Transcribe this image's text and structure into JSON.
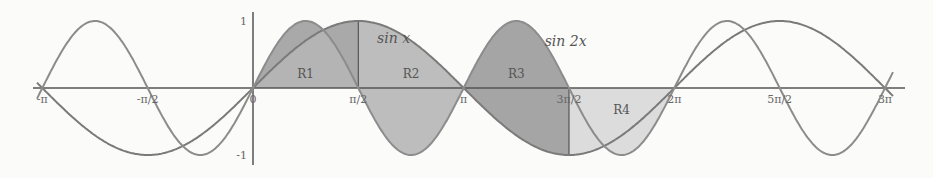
{
  "chart_data": {
    "type": "line",
    "title": "",
    "xlabel": "",
    "ylabel": "",
    "xlim": [
      -3.14159,
      9.42478
    ],
    "ylim": [
      -1,
      1
    ],
    "grid": false,
    "series": [
      {
        "name": "sin x",
        "function": "sin(x)",
        "color": "#7a7a7a"
      },
      {
        "name": "sin 2x",
        "function": "sin(2x)",
        "color": "#8c8c8c"
      }
    ],
    "x_ticks": [
      {
        "label": "-π",
        "value": -3.14159
      },
      {
        "label": "-π/2",
        "value": -1.5708
      },
      {
        "label": "0",
        "value": 0
      },
      {
        "label": "π/2",
        "value": 1.5708
      },
      {
        "label": "π",
        "value": 3.14159
      },
      {
        "label": "3π/2",
        "value": 4.71239
      },
      {
        "label": "2π",
        "value": 6.28319
      },
      {
        "label": "5π/2",
        "value": 7.85398
      },
      {
        "label": "3π",
        "value": 9.42478
      }
    ],
    "y_ticks": [
      {
        "label": "1",
        "value": 1
      },
      {
        "label": "-1",
        "value": -1
      }
    ],
    "regions": [
      {
        "label": "R1",
        "from": 0,
        "to": 1.5708,
        "color": "#a9a9a9"
      },
      {
        "label": "R2",
        "from": 1.5708,
        "to": 3.14159,
        "color": "#bdbdbd"
      },
      {
        "label": "R3",
        "from": 3.14159,
        "to": 4.71239,
        "color": "#a5a5a5"
      },
      {
        "label": "R4",
        "from": 4.71239,
        "to": 6.28319,
        "color": "#dcdcdc"
      }
    ],
    "annotations": [
      {
        "text": "sin x",
        "x": 1.85,
        "y": 0.6
      },
      {
        "text": "sin 2x",
        "x": 4.35,
        "y": 0.55
      }
    ]
  }
}
